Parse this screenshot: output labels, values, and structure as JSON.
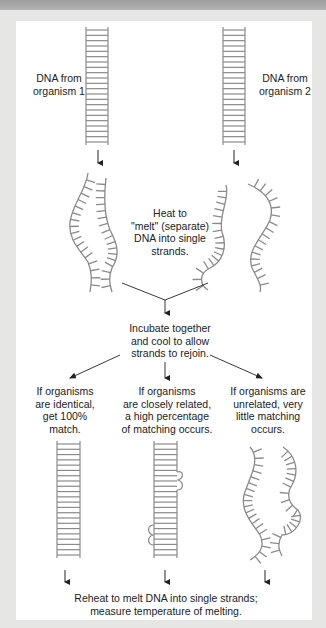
{
  "diagram": {
    "labels": {
      "dna_org1": "DNA from\norganism 1",
      "dna_org2": "DNA from\norganism 2",
      "heat_step": "Heat to\n\"melt\" (separate)\nDNA into single\nstrands.",
      "incubate_step": "Incubate together\nand cool to allow\nstrands to rejoin.",
      "outcome_identical": "If organisms\nare identical,\nget 100%\nmatch.",
      "outcome_related": "If organisms\nare closely related,\na high percentage\nof matching occurs.",
      "outcome_unrelated": "If organisms are\nunrelated, very\nlittle matching\noccurs.",
      "reheat_step": "Reheat to melt DNA into single strands;\nmeasure temperature of melting."
    },
    "colors": {
      "strand": "#8a8a8a",
      "arrow": "#222222",
      "panel": "#ffffff",
      "background": "#e6e6e4",
      "header_band": "#a8a8a8"
    }
  }
}
